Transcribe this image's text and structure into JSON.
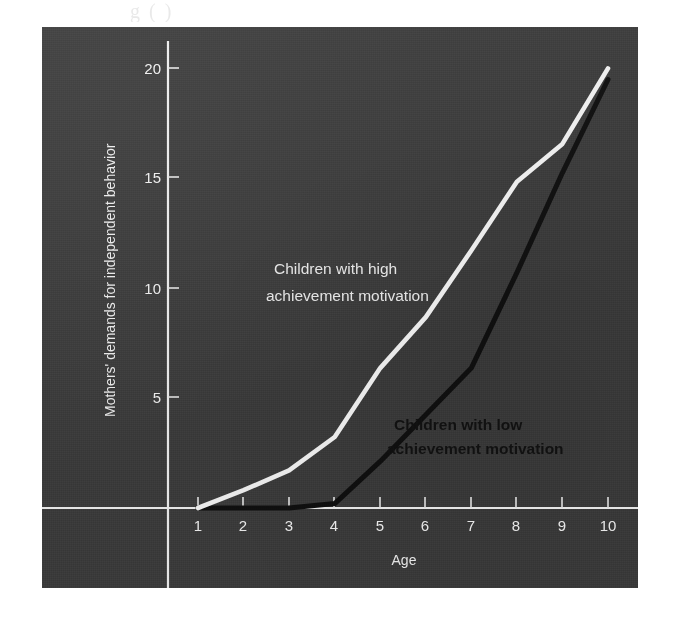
{
  "page": {
    "background_color": "#ffffff",
    "top_artifact_text": "g          ( )"
  },
  "panel": {
    "background_color": "#3d3d3d",
    "axis_color": "#f0f0f0"
  },
  "chart_data": {
    "type": "line",
    "title": "",
    "subtitle": "",
    "xlabel": "Age",
    "ylabel": "Mothers' demands for independent behavior",
    "x": [
      1,
      2,
      3,
      4,
      5,
      6,
      7,
      8,
      9,
      10
    ],
    "xticklabels": [
      "1",
      "2",
      "3",
      "4",
      "5",
      "6",
      "7",
      "8",
      "9",
      "10"
    ],
    "xlim": [
      1,
      10
    ],
    "ylim": [
      0,
      20
    ],
    "yticks": [
      5,
      10,
      15,
      20
    ],
    "yticklabels": [
      "5",
      "10",
      "15",
      "20"
    ],
    "grid": false,
    "legend_position": "inline-annotations",
    "series": [
      {
        "name": "Children with high achievement motivation",
        "label": "Children with high\nachievement motivation",
        "label_line1": "Children with high",
        "label_line2": "achievement motivation",
        "color": "#f5f5f5",
        "style": "solid-white",
        "values": [
          0,
          0.8,
          1.7,
          3.2,
          6.3,
          8.6,
          11.6,
          14.7,
          16.4,
          19.8
        ]
      },
      {
        "name": "Children with low achievement motivation",
        "label": "Children with low\nachievement motivation",
        "label_line1": "Children with low",
        "label_line2": "achievement motivation",
        "color": "#101010",
        "style": "solid-black",
        "values": [
          0,
          0,
          0,
          0.2,
          2.1,
          4.2,
          6.3,
          10.6,
          15.1,
          19.3
        ]
      }
    ],
    "annotations": [
      {
        "text": "Children with high achievement motivation",
        "color": "#ececec",
        "x": 3.6,
        "y": 12.6
      },
      {
        "text": "Children with low achievement motivation",
        "color": "#121212",
        "x": 7.1,
        "y": 3.6
      }
    ]
  }
}
